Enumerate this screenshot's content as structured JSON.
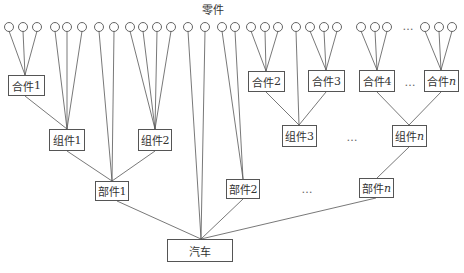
{
  "diagram": {
    "title": "零件",
    "title_pos": [
      213,
      9
    ],
    "line_color": "#555555",
    "circle_radius": 4.5,
    "circle_y": 27,
    "circles_x": [
      9,
      23,
      37,
      55,
      67,
      82,
      99,
      114,
      130,
      143,
      157,
      171,
      188,
      205,
      222,
      235,
      251,
      265,
      278,
      296,
      310,
      324,
      337,
      361,
      375,
      387,
      425,
      439,
      452
    ],
    "nodes": [
      {
        "id": "heji1",
        "label": "合件",
        "suffix": "1",
        "italic": false,
        "x": 8,
        "y": 75,
        "w": 37,
        "h": 21
      },
      {
        "id": "heji2",
        "label": "合件",
        "suffix": "2",
        "italic": false,
        "x": 248,
        "y": 71,
        "w": 37,
        "h": 21
      },
      {
        "id": "heji3",
        "label": "合件",
        "suffix": "3",
        "italic": false,
        "x": 308,
        "y": 70,
        "w": 37,
        "h": 22
      },
      {
        "id": "heji4",
        "label": "合件",
        "suffix": "4",
        "italic": false,
        "x": 359,
        "y": 70,
        "w": 36,
        "h": 22
      },
      {
        "id": "hejin",
        "label": "合件",
        "suffix": "n",
        "italic": true,
        "x": 424,
        "y": 70,
        "w": 35,
        "h": 22
      },
      {
        "id": "zujian1",
        "label": "组件",
        "suffix": "1",
        "italic": false,
        "x": 49,
        "y": 129,
        "w": 36,
        "h": 22
      },
      {
        "id": "zujian2",
        "label": "组件",
        "suffix": "2",
        "italic": false,
        "x": 138,
        "y": 129,
        "w": 34,
        "h": 22
      },
      {
        "id": "zujian3",
        "label": "组件",
        "suffix": "3",
        "italic": false,
        "x": 282,
        "y": 125,
        "w": 35,
        "h": 22
      },
      {
        "id": "zujiann",
        "label": "组件",
        "suffix": "n",
        "italic": true,
        "x": 392,
        "y": 125,
        "w": 35,
        "h": 22
      },
      {
        "id": "bujian1",
        "label": "部件",
        "suffix": "1",
        "italic": false,
        "x": 95,
        "y": 181,
        "w": 34,
        "h": 20
      },
      {
        "id": "bujian2",
        "label": "部件",
        "suffix": "2",
        "italic": false,
        "x": 226,
        "y": 179,
        "w": 34,
        "h": 20
      },
      {
        "id": "bujiann",
        "label": "部件",
        "suffix": "n",
        "italic": true,
        "x": 359,
        "y": 178,
        "w": 35,
        "h": 20
      },
      {
        "id": "qiche",
        "label": "汽车",
        "suffix": "",
        "italic": false,
        "x": 167,
        "y": 239,
        "w": 66,
        "h": 23
      }
    ],
    "ellipses": [
      {
        "text": "…",
        "x": 408,
        "y": 26
      },
      {
        "text": "…",
        "x": 410,
        "y": 82
      },
      {
        "text": "…",
        "x": 352,
        "y": 137
      },
      {
        "text": "…",
        "x": 307,
        "y": 189
      }
    ],
    "edges": [
      {
        "from": [
          9,
          31
        ],
        "to": [
          25,
          75
        ]
      },
      {
        "from": [
          23,
          31
        ],
        "to": [
          25,
          75
        ]
      },
      {
        "from": [
          37,
          31
        ],
        "to": [
          25,
          75
        ]
      },
      {
        "from": [
          55,
          31
        ],
        "to": [
          67,
          129
        ]
      },
      {
        "from": [
          67,
          31
        ],
        "to": [
          67,
          129
        ]
      },
      {
        "from": [
          82,
          31
        ],
        "to": [
          67,
          129
        ]
      },
      {
        "from": [
          25,
          96
        ],
        "to": [
          67,
          129
        ]
      },
      {
        "from": [
          99,
          31
        ],
        "to": [
          112,
          181
        ]
      },
      {
        "from": [
          114,
          31
        ],
        "to": [
          112,
          181
        ]
      },
      {
        "from": [
          130,
          31
        ],
        "to": [
          155,
          129
        ]
      },
      {
        "from": [
          143,
          31
        ],
        "to": [
          155,
          129
        ]
      },
      {
        "from": [
          157,
          31
        ],
        "to": [
          155,
          129
        ]
      },
      {
        "from": [
          171,
          31
        ],
        "to": [
          155,
          129
        ]
      },
      {
        "from": [
          67,
          151
        ],
        "to": [
          112,
          181
        ]
      },
      {
        "from": [
          155,
          151
        ],
        "to": [
          112,
          181
        ]
      },
      {
        "from": [
          117,
          201
        ],
        "to": [
          201,
          239
        ]
      },
      {
        "from": [
          188,
          31
        ],
        "to": [
          201,
          239
        ]
      },
      {
        "from": [
          205,
          31
        ],
        "to": [
          201,
          239
        ]
      },
      {
        "from": [
          222,
          31
        ],
        "to": [
          243,
          179
        ]
      },
      {
        "from": [
          235,
          31
        ],
        "to": [
          243,
          179
        ]
      },
      {
        "from": [
          243,
          199
        ],
        "to": [
          201,
          239
        ]
      },
      {
        "from": [
          376,
          198
        ],
        "to": [
          201,
          239
        ]
      },
      {
        "from": [
          251,
          31
        ],
        "to": [
          266,
          71
        ]
      },
      {
        "from": [
          265,
          31
        ],
        "to": [
          266,
          71
        ]
      },
      {
        "from": [
          278,
          31
        ],
        "to": [
          266,
          71
        ]
      },
      {
        "from": [
          296,
          31
        ],
        "to": [
          299,
          125
        ]
      },
      {
        "from": [
          310,
          31
        ],
        "to": [
          326,
          70
        ]
      },
      {
        "from": [
          324,
          31
        ],
        "to": [
          326,
          70
        ]
      },
      {
        "from": [
          337,
          31
        ],
        "to": [
          326,
          70
        ]
      },
      {
        "from": [
          361,
          31
        ],
        "to": [
          377,
          70
        ]
      },
      {
        "from": [
          375,
          31
        ],
        "to": [
          377,
          70
        ]
      },
      {
        "from": [
          387,
          31
        ],
        "to": [
          377,
          70
        ]
      },
      {
        "from": [
          425,
          31
        ],
        "to": [
          441,
          70
        ]
      },
      {
        "from": [
          439,
          31
        ],
        "to": [
          441,
          70
        ]
      },
      {
        "from": [
          452,
          31
        ],
        "to": [
          441,
          70
        ]
      },
      {
        "from": [
          266,
          92
        ],
        "to": [
          299,
          125
        ]
      },
      {
        "from": [
          326,
          92
        ],
        "to": [
          299,
          125
        ]
      },
      {
        "from": [
          377,
          92
        ],
        "to": [
          409,
          125
        ]
      },
      {
        "from": [
          441,
          92
        ],
        "to": [
          409,
          125
        ]
      },
      {
        "from": [
          409,
          147
        ],
        "to": [
          377,
          178
        ]
      }
    ]
  }
}
